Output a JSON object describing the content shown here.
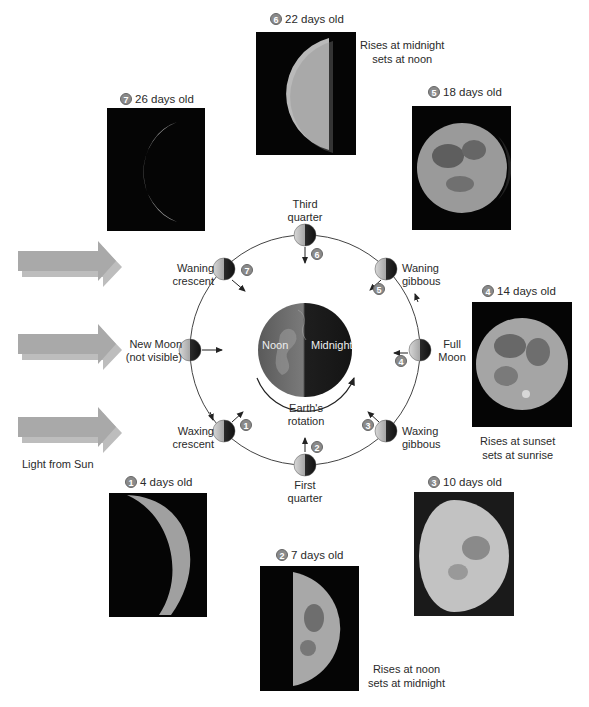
{
  "figure": {
    "light_source_label": "Light from Sun",
    "earth": {
      "day_side_label": "Noon",
      "night_side_label": "Midnight",
      "rotation_label_line1": "Earth's",
      "rotation_label_line2": "rotation"
    },
    "orbit_phases": [
      {
        "id": "new-moon",
        "line1": "New Moon",
        "line2": "(not visible)"
      },
      {
        "id": "waxing-crescent",
        "line1": "Waxing",
        "line2": "crescent",
        "step": "1"
      },
      {
        "id": "first-quarter",
        "line1": "First",
        "line2": "quarter",
        "step": "2"
      },
      {
        "id": "waxing-gibbous",
        "line1": "Waxing",
        "line2": "gibbous",
        "step": "3"
      },
      {
        "id": "full-moon",
        "line1": "Full",
        "line2": "Moon",
        "step": "4"
      },
      {
        "id": "waning-gibbous",
        "line1": "Waning",
        "line2": "gibbous",
        "step": "5"
      },
      {
        "id": "third-quarter",
        "line1": "Third",
        "line2": "quarter",
        "step": "6"
      },
      {
        "id": "waning-crescent",
        "line1": "Waning",
        "line2": "crescent",
        "step": "7"
      }
    ],
    "photos": [
      {
        "step": "1",
        "age": "4 days old"
      },
      {
        "step": "2",
        "age": "7 days old"
      },
      {
        "step": "3",
        "age": "10 days old"
      },
      {
        "step": "4",
        "age": "14 days old"
      },
      {
        "step": "5",
        "age": "18 days old"
      },
      {
        "step": "6",
        "age": "22 days old"
      },
      {
        "step": "7",
        "age": "26 days old"
      }
    ],
    "notes": {
      "third_quarter_line1": "Rises at midnight",
      "third_quarter_line2": "sets at noon",
      "full_moon_line1": "Rises at sunset",
      "full_moon_line2": "sets at sunrise",
      "first_quarter_line1": "Rises at noon",
      "first_quarter_line2": "sets at midnight"
    },
    "colors": {
      "sun_arrow": "#b8b8b8",
      "orbit_line": "#444444",
      "badge": "#8a8a8a",
      "photo_bg": "#050505",
      "earth_day": "#6c6c6c",
      "earth_night": "#1c1c1c"
    }
  }
}
